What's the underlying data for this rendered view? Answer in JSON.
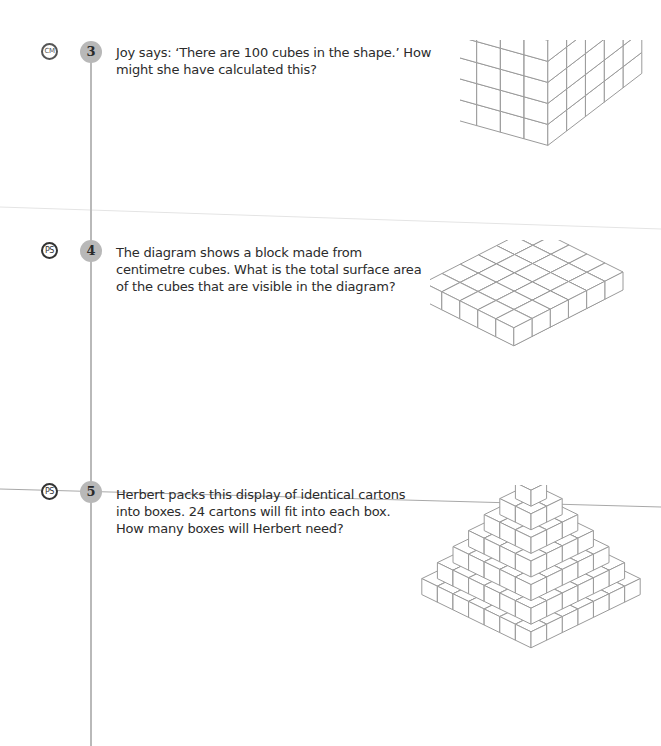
{
  "questions": [
    {
      "number": "3",
      "tag": "CM",
      "text_lines": [
        "Joy says: ‘There are 100 cubes in the shape.’ How",
        "might she have calculated this?"
      ],
      "figure": {
        "type": "cuboid",
        "width": 5,
        "depth": 4,
        "height": 5,
        "total_cubes": 100
      }
    },
    {
      "number": "4",
      "tag": "PS",
      "text_lines": [
        "The diagram shows a block made from",
        "centimetre cubes. What is the total surface area",
        "of the cubes that are visible in the diagram?"
      ],
      "figure": {
        "type": "stepped-block",
        "layers": 5,
        "top_layer": [
          2,
          1
        ],
        "bottom_layer": [
          6,
          5
        ]
      }
    },
    {
      "number": "5",
      "tag": "PS",
      "text_lines": [
        "Herbert packs this display of identical cartons",
        "into boxes. 24 cartons will fit into each box.",
        "How many boxes will Herbert need?"
      ],
      "figure": {
        "type": "square-pyramid",
        "layers": 7,
        "top_layer": [
          1,
          1
        ],
        "bottom_layer": [
          7,
          7
        ]
      }
    }
  ],
  "colors": {
    "line": "#9a9a9a",
    "badge_fill": "#b8b8b8",
    "text": "#2b2b2b"
  }
}
